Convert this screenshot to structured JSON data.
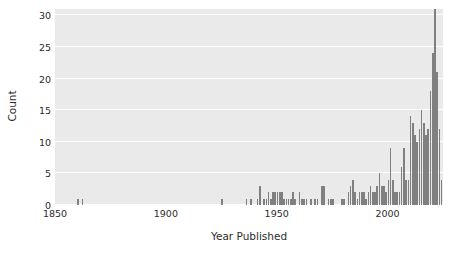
{
  "chart_data": {
    "type": "bar",
    "title": "",
    "subtitle": "",
    "xlabel": "Year Published",
    "ylabel": "Count",
    "xlim": [
      1850,
      2025
    ],
    "ylim": [
      0,
      31
    ],
    "xticks": [
      1850,
      1900,
      1950,
      2000
    ],
    "xticklabels": [
      "1850",
      "1900",
      "1950",
      "2000"
    ],
    "yticks": [
      0,
      5,
      10,
      15,
      20,
      25,
      30
    ],
    "yticklabels": [
      "0",
      "5",
      "10",
      "15",
      "20",
      "25",
      "30"
    ],
    "grid": "horizontal-white-on-gray",
    "legend": "none",
    "bar_color": "#808080",
    "plot_background": "#eaeaea",
    "figure_background": "#ffffff",
    "text_color": "#2b2b2b",
    "bin_width_years": 1,
    "categories": [
      1860,
      1862,
      1925,
      1936,
      1938,
      1941,
      1942,
      1944,
      1945,
      1946,
      1947,
      1948,
      1949,
      1950,
      1951,
      1952,
      1953,
      1954,
      1955,
      1956,
      1957,
      1958,
      1960,
      1961,
      1962,
      1963,
      1965,
      1967,
      1968,
      1970,
      1971,
      1973,
      1974,
      1975,
      1979,
      1980,
      1982,
      1983,
      1984,
      1985,
      1986,
      1987,
      1988,
      1989,
      1990,
      1991,
      1992,
      1993,
      1994,
      1995,
      1996,
      1997,
      1998,
      1999,
      2000,
      2001,
      2002,
      2003,
      2004,
      2005,
      2006,
      2007,
      2008,
      2009,
      2010,
      2011,
      2012,
      2013,
      2014,
      2015,
      2016,
      2017,
      2018,
      2019,
      2020,
      2021,
      2022,
      2023,
      2024
    ],
    "values": [
      1,
      1,
      1,
      1,
      1,
      1,
      3,
      1,
      1,
      2,
      1,
      2,
      2,
      2,
      2,
      2,
      1,
      1,
      1,
      1,
      2,
      1,
      2,
      1,
      1,
      1,
      1,
      1,
      1,
      3,
      3,
      1,
      1,
      1,
      1,
      1,
      2,
      3,
      4,
      2,
      1,
      2,
      2,
      2,
      1,
      2,
      3,
      2,
      2,
      3,
      5,
      3,
      3,
      2,
      4,
      9,
      4,
      2,
      2,
      2,
      6,
      9,
      4,
      4,
      14,
      13,
      11,
      10,
      12,
      15,
      13,
      11,
      12,
      18,
      24,
      31,
      21,
      12,
      4
    ]
  }
}
